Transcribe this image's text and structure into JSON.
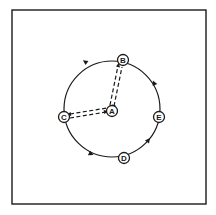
{
  "diagram": {
    "type": "network-graph",
    "frame": {
      "x": 12,
      "y": 10,
      "width": 194,
      "height": 194
    },
    "circle": {
      "cx": 112,
      "cy": 109,
      "r": 48,
      "direction": "counter-clockwise"
    },
    "colors": {
      "stroke": "#1a1a1a",
      "background": "#ffffff"
    },
    "nodes": [
      {
        "id": "A",
        "label": "A",
        "x": 112,
        "y": 111,
        "position": "center"
      },
      {
        "id": "B",
        "label": "B",
        "x": 123,
        "y": 60,
        "position": "top"
      },
      {
        "id": "C",
        "label": "C",
        "x": 64,
        "y": 117,
        "position": "left"
      },
      {
        "id": "D",
        "label": "D",
        "x": 124,
        "y": 158,
        "position": "bottom"
      },
      {
        "id": "E",
        "label": "E",
        "x": 159,
        "y": 117,
        "position": "right"
      }
    ],
    "dashed_links": [
      {
        "from": "A",
        "to": "B",
        "style": "double-dashed",
        "bidirectional": true
      },
      {
        "from": "A",
        "to": "C",
        "style": "double-dashed",
        "bidirectional": true
      }
    ],
    "ring_arrows": [
      {
        "x": 87,
        "y": 63,
        "angle": 215
      },
      {
        "x": 89,
        "y": 153,
        "angle": 25
      },
      {
        "x": 147,
        "y": 142,
        "angle": -55
      },
      {
        "x": 155,
        "y": 85,
        "angle": -115
      }
    ]
  }
}
